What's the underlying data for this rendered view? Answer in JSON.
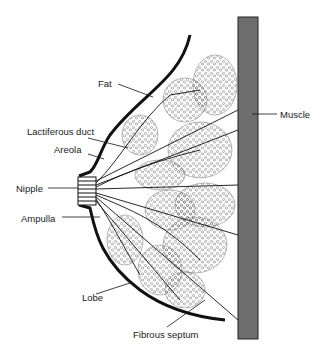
{
  "figure": {
    "colors": {
      "outline": "#111111",
      "muscle": "#6e6e6e",
      "lobule_stipple": "#555555",
      "background": "#ffffff"
    },
    "labels": {
      "fat": "Fat",
      "lactiferous_duct": "Lactiferous duct",
      "areola": "Areola",
      "nipple": "Nipple",
      "ampulla": "Ampulla",
      "lobe": "Lobe",
      "fibrous_septum": "Fibrous septum",
      "muscle": "Muscle"
    }
  }
}
